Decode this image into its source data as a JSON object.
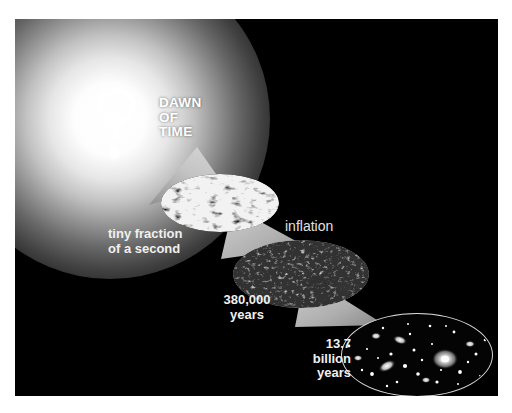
{
  "figure": {
    "background_color": "#000000",
    "page_background": "#ffffff",
    "text_color": "#f0f0f0"
  },
  "labels": {
    "dawn_of_time": "DAWN\nOF\nTIME",
    "question_mark": "?",
    "tiny_fraction": "tiny fraction\nof a second",
    "inflation": "inflation",
    "years_380k": "380,000\nyears",
    "years_137b": "13.7\nbillion\nyears"
  },
  "panels": [
    {
      "id": "foam",
      "name": "quantum-foam-ellipse",
      "caption": "tiny fraction\nof a second",
      "texture": "high-contrast-marbled",
      "outline": false
    },
    {
      "id": "cmb",
      "name": "cmb-ellipse",
      "caption": "380,000\nyears",
      "texture": "light-gray-mottled",
      "outline": false
    },
    {
      "id": "galaxies",
      "name": "galaxies-ellipse",
      "caption": "13.7\nbillion\nyears",
      "texture": "dark-starfield",
      "outline": true,
      "outline_color": "#d8d8d8"
    }
  ],
  "connectors": [
    {
      "id": "wedge-1",
      "from": "dawn-of-time-glow",
      "to": "quantum-foam-ellipse"
    },
    {
      "id": "wedge-2",
      "from": "quantum-foam-ellipse",
      "to": "cmb-ellipse",
      "label": "inflation"
    },
    {
      "id": "wedge-3",
      "from": "cmb-ellipse",
      "to": "galaxies-ellipse"
    }
  ],
  "colors": {
    "glow_core": "#ffffff",
    "wedge": "#b9b9b9",
    "panel_outline": "#d8d8d8",
    "label": "#f0f0f0"
  }
}
